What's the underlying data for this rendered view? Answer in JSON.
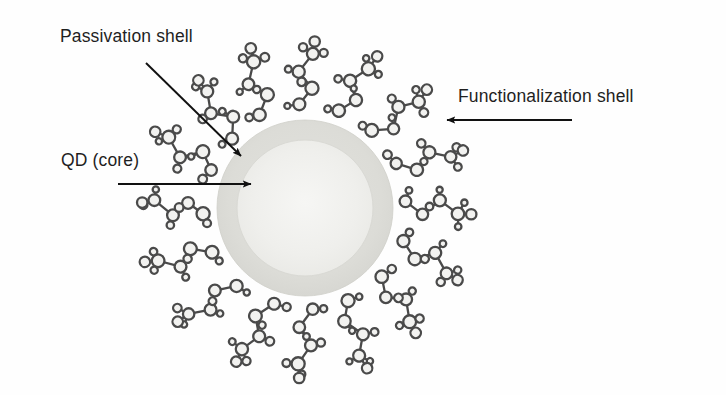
{
  "figure": {
    "width": 726,
    "height": 395,
    "background_color": "#fefefe"
  },
  "labels": {
    "passivation_shell": "Passivation shell",
    "qd_core": "QD (core)",
    "functionalization_shell": "Functionalization shell"
  },
  "colors": {
    "text": "#1f1f1f",
    "arrow": "#111111",
    "core_fill": "#eeeeec",
    "shell_fill": "#dededa",
    "molecule_stroke": "#4a4a4a",
    "molecule_fill": "#f2f2f0"
  },
  "particle": {
    "center_x": 305,
    "center_y": 208,
    "shell_outer_radius": 88,
    "core_radius": 68
  },
  "arrows": [
    {
      "name": "passivation-shell-arrow",
      "x1": 146,
      "y1": 63,
      "x2": 241,
      "y2": 156,
      "direction": "down-right"
    },
    {
      "name": "qd-core-arrow",
      "x1": 118,
      "y1": 184,
      "x2": 251,
      "y2": 184,
      "direction": "right"
    },
    {
      "name": "functionalization-shell-arrow",
      "x1": 572,
      "y1": 120,
      "x2": 447,
      "y2": 120,
      "direction": "left"
    }
  ],
  "ligands": [
    {
      "name": "ligand-1",
      "angle_deg": 270,
      "label": "ligand molecule at top"
    },
    {
      "name": "ligand-2",
      "angle_deg": 292,
      "label": "ligand molecule upper right"
    },
    {
      "name": "ligand-3",
      "angle_deg": 315,
      "label": "ligand molecule upper right"
    },
    {
      "name": "ligand-4",
      "angle_deg": 338,
      "label": "ligand molecule right upper"
    },
    {
      "name": "ligand-5",
      "angle_deg": 0,
      "label": "ligand molecule right"
    },
    {
      "name": "ligand-6",
      "angle_deg": 22,
      "label": "ligand molecule right lower"
    },
    {
      "name": "ligand-7",
      "angle_deg": 45,
      "label": "ligand molecule lower right"
    },
    {
      "name": "ligand-8",
      "angle_deg": 68,
      "label": "ligand molecule lower right"
    },
    {
      "name": "ligand-9",
      "angle_deg": 90,
      "label": "ligand molecule at bottom"
    },
    {
      "name": "ligand-10",
      "angle_deg": 112,
      "label": "ligand molecule lower left"
    },
    {
      "name": "ligand-11",
      "angle_deg": 135,
      "label": "ligand molecule lower left"
    },
    {
      "name": "ligand-12",
      "angle_deg": 158,
      "label": "ligand molecule left lower"
    },
    {
      "name": "ligand-13",
      "angle_deg": 180,
      "label": "ligand molecule left"
    },
    {
      "name": "ligand-14",
      "angle_deg": 205,
      "label": "ligand molecule left upper"
    },
    {
      "name": "ligand-15",
      "angle_deg": 228,
      "label": "ligand molecule upper left"
    },
    {
      "name": "ligand-16",
      "angle_deg": 248,
      "label": "ligand molecule upper left"
    }
  ]
}
